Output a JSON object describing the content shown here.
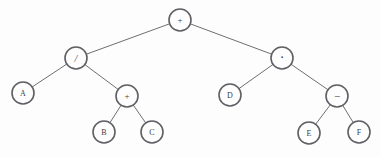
{
  "figure": {
    "background_color": "#fdfdfd",
    "node_fill_color": "#fefefe",
    "node_stroke_color": "#5f5f64",
    "edge_color": "#6f6f73",
    "label_color": "#3b3b40",
    "node_radius": 11
  },
  "chart_data": {
    "type": "diagram",
    "diagram_kind": "binary-expression-tree",
    "expression": "(A / (B + C)) + (D * (E - F))",
    "nodes": [
      {
        "id": "n0",
        "label": "+",
        "kind": "operator",
        "x": 180,
        "y": 20,
        "r": 11
      },
      {
        "id": "n1",
        "label": "/",
        "kind": "operator",
        "x": 76,
        "y": 58,
        "r": 11
      },
      {
        "id": "n2",
        "label": "·",
        "kind": "operator",
        "x": 282,
        "y": 58,
        "r": 11
      },
      {
        "id": "n3",
        "label": "A",
        "kind": "operand",
        "x": 23,
        "y": 93,
        "r": 11
      },
      {
        "id": "n4",
        "label": "+",
        "kind": "operator",
        "x": 127,
        "y": 96,
        "r": 11
      },
      {
        "id": "n5",
        "label": "D",
        "kind": "operand",
        "x": 230,
        "y": 95,
        "r": 11
      },
      {
        "id": "n6",
        "label": "−",
        "kind": "operator",
        "x": 337,
        "y": 96,
        "r": 11
      },
      {
        "id": "n7",
        "label": "B",
        "kind": "operand",
        "x": 104,
        "y": 132,
        "r": 11
      },
      {
        "id": "n8",
        "label": "C",
        "kind": "operand",
        "x": 152,
        "y": 132,
        "r": 11
      },
      {
        "id": "n9",
        "label": "E",
        "kind": "operand",
        "x": 309,
        "y": 133,
        "r": 11
      },
      {
        "id": "n10",
        "label": "F",
        "kind": "operand",
        "x": 359,
        "y": 132,
        "r": 11
      }
    ],
    "edges": [
      {
        "from": "n0",
        "to": "n1"
      },
      {
        "from": "n0",
        "to": "n2"
      },
      {
        "from": "n1",
        "to": "n3"
      },
      {
        "from": "n1",
        "to": "n4"
      },
      {
        "from": "n2",
        "to": "n5"
      },
      {
        "from": "n2",
        "to": "n6"
      },
      {
        "from": "n4",
        "to": "n7"
      },
      {
        "from": "n4",
        "to": "n8"
      },
      {
        "from": "n6",
        "to": "n9"
      },
      {
        "from": "n6",
        "to": "n10"
      }
    ]
  }
}
